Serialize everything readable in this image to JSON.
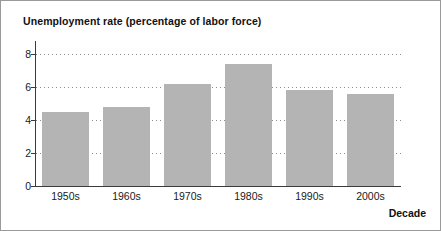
{
  "chart_data": {
    "type": "bar",
    "title": "Unemployment rate (percentage of labor force)",
    "xlabel": "Decade",
    "ylabel": "",
    "categories": [
      "1950s",
      "1960s",
      "1970s",
      "1980s",
      "1990s",
      "2000s"
    ],
    "values": [
      4.5,
      4.8,
      6.2,
      7.4,
      5.8,
      5.6
    ],
    "ylim": [
      0,
      8.8
    ],
    "yticks": [
      0,
      2,
      4,
      6,
      8
    ],
    "ytick_labels": [
      "0",
      "2",
      "4",
      "6",
      "8"
    ],
    "grid": "horizontal-dotted",
    "legend": null,
    "bar_color": "#b4b4b4",
    "axis_color": "#3a3a3a",
    "gridline_color": "#8d8d8d",
    "background_color": "#ffffff",
    "border_color": "#9a9a9a"
  }
}
